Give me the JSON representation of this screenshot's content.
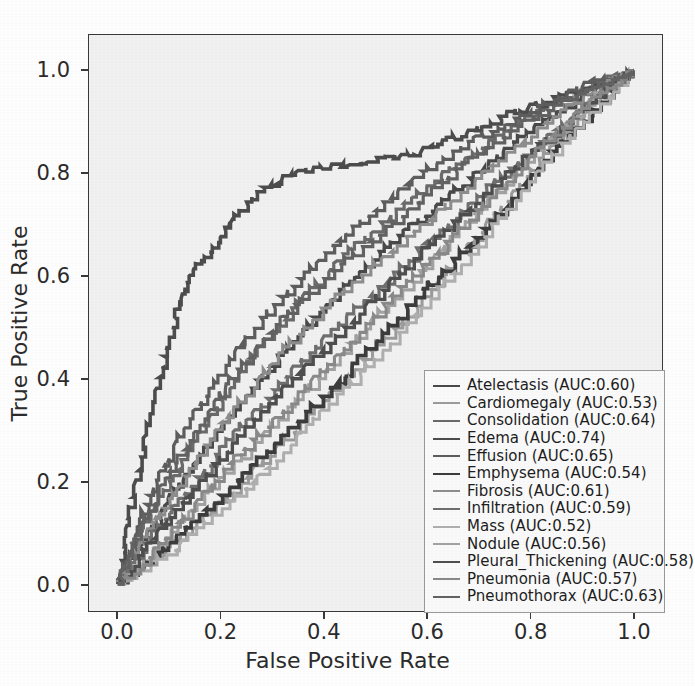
{
  "chart_data": {
    "type": "line",
    "title": "",
    "xlabel": "False Positive Rate",
    "ylabel": "True Positive Rate",
    "xlim": [
      0.0,
      1.0
    ],
    "ylim": [
      0.0,
      1.0
    ],
    "xticks": [
      "0.0",
      "0.2",
      "0.4",
      "0.6",
      "0.8",
      "1.0"
    ],
    "yticks": [
      "0.0",
      "0.2",
      "0.4",
      "0.6",
      "0.8",
      "1.0"
    ],
    "xtick_values": [
      0.0,
      0.2,
      0.4,
      0.6,
      0.8,
      1.0
    ],
    "ytick_values": [
      0.0,
      0.2,
      0.4,
      0.6,
      0.8,
      1.0
    ],
    "grid": false,
    "legend_position": "lower right",
    "plot_background": "#f2f2f2",
    "figure_background": "#ffffff",
    "series": [
      {
        "name": "Atelectasis",
        "auc": 0.6,
        "label": "Atelectasis (AUC:0.60)",
        "color": "#4a4a4a",
        "width": 2.0,
        "x": [
          0.0,
          0.02,
          0.05,
          0.08,
          0.1,
          0.14,
          0.18,
          0.22,
          0.26,
          0.3,
          0.34,
          0.38,
          0.43,
          0.47,
          0.52,
          0.57,
          0.62,
          0.67,
          0.72,
          0.78,
          0.84,
          0.9,
          0.95,
          1.0
        ],
        "y": [
          0.0,
          0.04,
          0.09,
          0.13,
          0.17,
          0.22,
          0.28,
          0.33,
          0.38,
          0.43,
          0.47,
          0.52,
          0.57,
          0.61,
          0.66,
          0.7,
          0.74,
          0.78,
          0.82,
          0.87,
          0.91,
          0.95,
          0.98,
          1.0
        ]
      },
      {
        "name": "Cardiomegaly",
        "auc": 0.53,
        "label": "Cardiomegaly (AUC:0.53)",
        "color": "#9c9c9c",
        "width": 1.8,
        "x": [
          0.0,
          0.03,
          0.07,
          0.12,
          0.17,
          0.22,
          0.28,
          0.34,
          0.4,
          0.46,
          0.52,
          0.58,
          0.63,
          0.68,
          0.73,
          0.78,
          0.83,
          0.88,
          0.93,
          0.97,
          1.0
        ],
        "y": [
          0.0,
          0.02,
          0.05,
          0.09,
          0.13,
          0.18,
          0.24,
          0.3,
          0.36,
          0.42,
          0.48,
          0.54,
          0.6,
          0.66,
          0.72,
          0.78,
          0.84,
          0.89,
          0.94,
          0.98,
          1.0
        ]
      },
      {
        "name": "Consolidation",
        "auc": 0.64,
        "label": "Consolidation (AUC:0.64)",
        "color": "#6b6b6b",
        "width": 1.9,
        "x": [
          0.0,
          0.02,
          0.04,
          0.07,
          0.1,
          0.13,
          0.17,
          0.21,
          0.25,
          0.3,
          0.35,
          0.4,
          0.45,
          0.51,
          0.57,
          0.63,
          0.69,
          0.75,
          0.81,
          0.87,
          0.93,
          1.0
        ],
        "y": [
          0.0,
          0.05,
          0.1,
          0.15,
          0.2,
          0.25,
          0.31,
          0.37,
          0.43,
          0.49,
          0.55,
          0.6,
          0.65,
          0.7,
          0.75,
          0.8,
          0.84,
          0.88,
          0.92,
          0.95,
          0.98,
          1.0
        ]
      },
      {
        "name": "Edema",
        "auc": 0.74,
        "label": "Edema (AUC:0.74)",
        "color": "#4d4d4d",
        "width": 2.1,
        "x": [
          0.0,
          0.01,
          0.02,
          0.04,
          0.06,
          0.08,
          0.1,
          0.12,
          0.14,
          0.17,
          0.2,
          0.23,
          0.27,
          0.32,
          0.38,
          0.45,
          0.52,
          0.58,
          0.63,
          0.68,
          0.74,
          0.8,
          0.86,
          0.92,
          0.97,
          1.0
        ],
        "y": [
          0.0,
          0.06,
          0.13,
          0.22,
          0.31,
          0.4,
          0.48,
          0.55,
          0.6,
          0.64,
          0.68,
          0.72,
          0.76,
          0.79,
          0.81,
          0.82,
          0.83,
          0.84,
          0.86,
          0.88,
          0.91,
          0.93,
          0.95,
          0.97,
          0.99,
          1.0
        ]
      },
      {
        "name": "Effusion",
        "auc": 0.65,
        "label": "Effusion (AUC:0.65)",
        "color": "#5e5e5e",
        "width": 1.9,
        "x": [
          0.0,
          0.02,
          0.04,
          0.06,
          0.09,
          0.12,
          0.16,
          0.2,
          0.24,
          0.29,
          0.34,
          0.39,
          0.44,
          0.5,
          0.56,
          0.62,
          0.68,
          0.74,
          0.8,
          0.86,
          0.92,
          1.0
        ],
        "y": [
          0.0,
          0.05,
          0.11,
          0.17,
          0.23,
          0.29,
          0.35,
          0.41,
          0.47,
          0.53,
          0.58,
          0.63,
          0.68,
          0.73,
          0.78,
          0.82,
          0.86,
          0.89,
          0.92,
          0.95,
          0.98,
          1.0
        ]
      },
      {
        "name": "Emphysema",
        "auc": 0.54,
        "label": "Emphysema (AUC:0.54)",
        "color": "#3d3d3d",
        "width": 2.2,
        "x": [
          0.0,
          0.04,
          0.09,
          0.14,
          0.2,
          0.26,
          0.32,
          0.38,
          0.44,
          0.5,
          0.56,
          0.62,
          0.68,
          0.74,
          0.79,
          0.84,
          0.89,
          0.94,
          0.98,
          1.0
        ],
        "y": [
          0.0,
          0.03,
          0.07,
          0.12,
          0.17,
          0.23,
          0.29,
          0.35,
          0.41,
          0.47,
          0.54,
          0.6,
          0.66,
          0.72,
          0.78,
          0.84,
          0.89,
          0.94,
          0.98,
          1.0
        ]
      },
      {
        "name": "Fibrosis",
        "auc": 0.61,
        "label": "Fibrosis (AUC:0.61)",
        "color": "#8e8e8e",
        "width": 1.8,
        "x": [
          0.0,
          0.02,
          0.05,
          0.08,
          0.12,
          0.16,
          0.2,
          0.25,
          0.3,
          0.35,
          0.41,
          0.47,
          0.53,
          0.59,
          0.65,
          0.71,
          0.77,
          0.83,
          0.89,
          0.95,
          1.0
        ],
        "y": [
          0.0,
          0.04,
          0.09,
          0.14,
          0.19,
          0.25,
          0.31,
          0.37,
          0.43,
          0.49,
          0.55,
          0.6,
          0.65,
          0.7,
          0.75,
          0.8,
          0.85,
          0.9,
          0.94,
          0.98,
          1.0
        ]
      },
      {
        "name": "Infiltration",
        "auc": 0.59,
        "label": "Infiltration (AUC:0.59)",
        "color": "#707070",
        "width": 1.9,
        "x": [
          0.0,
          0.03,
          0.06,
          0.1,
          0.14,
          0.19,
          0.24,
          0.29,
          0.34,
          0.4,
          0.46,
          0.52,
          0.58,
          0.64,
          0.7,
          0.76,
          0.82,
          0.88,
          0.94,
          1.0
        ],
        "y": [
          0.0,
          0.04,
          0.09,
          0.14,
          0.19,
          0.25,
          0.31,
          0.36,
          0.42,
          0.48,
          0.54,
          0.59,
          0.65,
          0.7,
          0.76,
          0.81,
          0.86,
          0.91,
          0.96,
          1.0
        ]
      },
      {
        "name": "Mass",
        "auc": 0.52,
        "label": "Mass (AUC:0.52)",
        "color": "#b0b0b0",
        "width": 1.8,
        "x": [
          0.0,
          0.05,
          0.11,
          0.17,
          0.23,
          0.29,
          0.35,
          0.41,
          0.47,
          0.53,
          0.59,
          0.65,
          0.71,
          0.77,
          0.83,
          0.89,
          0.95,
          1.0
        ],
        "y": [
          0.0,
          0.03,
          0.07,
          0.12,
          0.17,
          0.23,
          0.29,
          0.35,
          0.41,
          0.47,
          0.54,
          0.61,
          0.68,
          0.75,
          0.82,
          0.89,
          0.95,
          1.0
        ]
      },
      {
        "name": "Nodule",
        "auc": 0.56,
        "label": "Nodule (AUC:0.56)",
        "color": "#a3a3a3",
        "width": 1.8,
        "x": [
          0.0,
          0.04,
          0.08,
          0.13,
          0.18,
          0.24,
          0.3,
          0.36,
          0.42,
          0.48,
          0.54,
          0.6,
          0.66,
          0.72,
          0.78,
          0.84,
          0.9,
          0.96,
          1.0
        ],
        "y": [
          0.0,
          0.03,
          0.08,
          0.13,
          0.19,
          0.25,
          0.31,
          0.37,
          0.43,
          0.5,
          0.56,
          0.62,
          0.69,
          0.75,
          0.81,
          0.87,
          0.93,
          0.98,
          1.0
        ]
      },
      {
        "name": "Pleural_Thickening",
        "auc": 0.58,
        "label": "Pleural_Thickening (AUC:0.58)",
        "color": "#4f4f4f",
        "width": 2.0,
        "x": [
          0.0,
          0.03,
          0.07,
          0.11,
          0.16,
          0.21,
          0.26,
          0.32,
          0.38,
          0.44,
          0.5,
          0.56,
          0.62,
          0.68,
          0.74,
          0.8,
          0.86,
          0.92,
          0.97,
          1.0
        ],
        "y": [
          0.0,
          0.04,
          0.09,
          0.14,
          0.2,
          0.26,
          0.32,
          0.38,
          0.44,
          0.5,
          0.56,
          0.62,
          0.68,
          0.73,
          0.79,
          0.84,
          0.89,
          0.94,
          0.98,
          1.0
        ]
      },
      {
        "name": "Pneumonia",
        "auc": 0.57,
        "label": "Pneumonia (AUC:0.57)",
        "color": "#8a8a8a",
        "width": 1.8,
        "x": [
          0.0,
          0.04,
          0.08,
          0.13,
          0.18,
          0.23,
          0.29,
          0.35,
          0.41,
          0.47,
          0.53,
          0.59,
          0.65,
          0.71,
          0.77,
          0.83,
          0.89,
          0.95,
          1.0
        ],
        "y": [
          0.0,
          0.03,
          0.08,
          0.13,
          0.19,
          0.25,
          0.31,
          0.37,
          0.43,
          0.49,
          0.56,
          0.62,
          0.68,
          0.74,
          0.8,
          0.86,
          0.92,
          0.97,
          1.0
        ]
      },
      {
        "name": "Pneumothorax",
        "auc": 0.63,
        "label": "Pneumothorax (AUC:0.63)",
        "color": "#636363",
        "width": 1.9,
        "x": [
          0.0,
          0.02,
          0.04,
          0.07,
          0.1,
          0.14,
          0.18,
          0.22,
          0.27,
          0.32,
          0.37,
          0.43,
          0.49,
          0.55,
          0.61,
          0.67,
          0.73,
          0.79,
          0.85,
          0.91,
          0.96,
          1.0
        ],
        "y": [
          0.0,
          0.05,
          0.1,
          0.16,
          0.22,
          0.28,
          0.34,
          0.4,
          0.46,
          0.52,
          0.57,
          0.62,
          0.67,
          0.72,
          0.77,
          0.82,
          0.86,
          0.9,
          0.93,
          0.96,
          0.98,
          1.0
        ]
      }
    ]
  }
}
